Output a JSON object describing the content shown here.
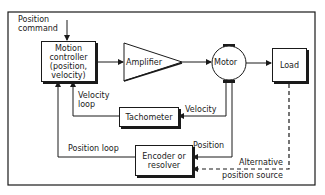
{
  "diagram": {
    "inputs": {
      "position_command": [
        "Position",
        "command"
      ]
    },
    "blocks": {
      "motion_controller": [
        "Motion",
        "controller",
        "(position,",
        "velocity)"
      ],
      "amplifier": "Amplifier",
      "motor": "Motor",
      "load": "Load",
      "tachometer": "Tachometer",
      "encoder": [
        "Encoder or",
        "resolver"
      ]
    },
    "signals": {
      "velocity": "Velocity",
      "position": "Position",
      "velocity_loop": [
        "Velocity",
        "loop"
      ],
      "position_loop": "Position loop",
      "alternative": [
        "Alternative",
        "position source"
      ]
    },
    "colors": {
      "line": "#1a1a1a",
      "background": "#ffffff"
    }
  }
}
